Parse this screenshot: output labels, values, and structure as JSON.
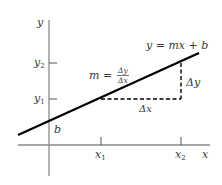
{
  "diagram": {
    "axes": {
      "x_label": "x",
      "y_label": "y"
    },
    "ticks": {
      "x": [
        {
          "label": "x",
          "sub": "1"
        },
        {
          "label": "x",
          "sub": "2"
        }
      ],
      "y": [
        {
          "label": "y",
          "sub": "2"
        },
        {
          "label": "y",
          "sub": "1"
        }
      ]
    },
    "line_equation": "y = mx + b",
    "intercept_label": "b",
    "slope": {
      "lhs": "m =",
      "numerator": "Δy",
      "denominator": "Δx"
    },
    "delta_x_label": "Δx",
    "delta_y_label": "Δy",
    "colors": {
      "axis": "#8a8a8a",
      "line": "#000000",
      "text": "#3a3a3a"
    }
  }
}
